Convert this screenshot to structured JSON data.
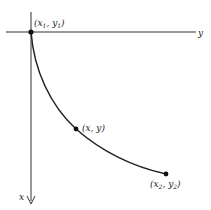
{
  "diagram": {
    "axes": {
      "horizontal_label": "y",
      "vertical_label": "x"
    },
    "points": [
      {
        "id": "p1",
        "label": "(x",
        "sub1": "1",
        "mid": ", y",
        "sub2": "1",
        "end": ")"
      },
      {
        "id": "p",
        "label": "(x, y)"
      },
      {
        "id": "p2",
        "label": "(x",
        "sub1": "2",
        "mid": ", y",
        "sub2": "2",
        "end": ")"
      }
    ],
    "curve": "path from (x1, y1) through (x, y) to (x2, y2)",
    "colors": {
      "ink": "#222222",
      "background": "#ffffff"
    }
  }
}
